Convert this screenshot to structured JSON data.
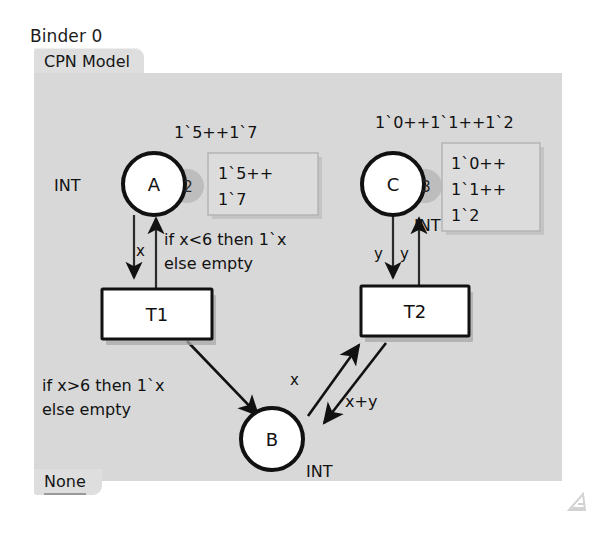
{
  "window": {
    "title": "Binder 0",
    "top_tab": "CPN Model",
    "bottom_tab": "None"
  },
  "colors": {
    "canvas_bg": "#d8d8d8",
    "tab_bg": "#dedede",
    "page_bg": "#ffffff",
    "stroke": "#111111",
    "token_badge": "#b9b9b9",
    "marking_box": "#dcdcdc"
  },
  "diagram": {
    "type": "colored-petri-net",
    "places": [
      {
        "id": "A",
        "name": "A",
        "colorset": "INT",
        "colorset_position": "left",
        "token_count": "2",
        "marking_inline": "1`5++1`7",
        "marking_box_lines": [
          "1`5++",
          "1`7"
        ]
      },
      {
        "id": "C",
        "name": "C",
        "colorset": "INT",
        "colorset_position": "bottom-right",
        "token_count": "3",
        "marking_inline": "1`0++1`1++1`2",
        "marking_box_lines": [
          "1`0++",
          "1`1++",
          "1`2"
        ]
      },
      {
        "id": "B",
        "name": "B",
        "colorset": "INT",
        "colorset_position": "bottom-right",
        "token_count": "",
        "marking_inline": "",
        "marking_box_lines": []
      }
    ],
    "transitions": [
      {
        "id": "T1",
        "name": "T1"
      },
      {
        "id": "T2",
        "name": "T2"
      }
    ],
    "arcs": [
      {
        "id": "a-to-t1",
        "from": "A",
        "to": "T1",
        "inscription": "x"
      },
      {
        "id": "t1-to-a",
        "from": "T1",
        "to": "A",
        "inscription_lines": [
          "if x<6 then 1`x",
          "else empty"
        ]
      },
      {
        "id": "t1-to-b",
        "from": "T1",
        "to": "B",
        "inscription_lines": [
          "if x>6 then 1`x",
          "else empty"
        ]
      },
      {
        "id": "c-to-t2",
        "from": "C",
        "to": "T2",
        "inscription": "y"
      },
      {
        "id": "t2-to-c",
        "from": "T2",
        "to": "C",
        "inscription": "y"
      },
      {
        "id": "b-to-t2",
        "from": "B",
        "to": "T2",
        "inscription": "x"
      },
      {
        "id": "t2-to-b",
        "from": "T2",
        "to": "B",
        "inscription": "x+y"
      }
    ]
  }
}
